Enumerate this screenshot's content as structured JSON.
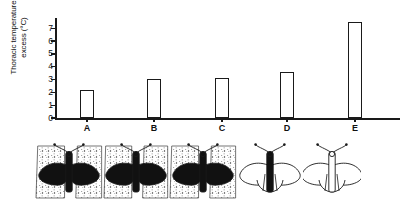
{
  "chart_data": {
    "type": "bar",
    "title": "",
    "xlabel": "",
    "ylabel": "Thoracic temperature excess (°C)",
    "ylabel_line1": "Thoracic temperature",
    "ylabel_line2": "excess (°C)",
    "categories": [
      "A",
      "B",
      "C",
      "D",
      "E"
    ],
    "values": [
      2.2,
      3.05,
      3.1,
      3.6,
      7.5
    ],
    "ylim": [
      0,
      7.8
    ],
    "yticks": [
      0,
      1,
      2,
      3,
      4,
      5,
      6,
      7
    ],
    "ytick_labels": [
      "0",
      "1",
      "2",
      "3",
      "4",
      "5",
      "6",
      "7"
    ],
    "grid": false,
    "legend": false,
    "bar_fill": "#ffffff",
    "bar_edge": "#1a1a1a",
    "axis_color": "#1a1a1a"
  },
  "illustrations": {
    "caption": "",
    "items": [
      {
        "id": "A",
        "name": "moth-on-dark-background-wings-fully-dark",
        "background": "stippled",
        "body_shade": "dark",
        "wing_shade": "dark",
        "wings_spread": true
      },
      {
        "id": "B",
        "name": "moth-on-stippled-background-wings-dark",
        "background": "stippled",
        "body_shade": "dark",
        "wing_shade": "dark",
        "wings_spread": true
      },
      {
        "id": "C",
        "name": "moth-on-stippled-background-wings-part-dark",
        "background": "stippled",
        "body_shade": "dark",
        "wing_shade": "part-dark",
        "wings_spread": true
      },
      {
        "id": "D",
        "name": "moth-plain-background-dark-body-outline-wings",
        "background": "plain",
        "body_shade": "dark",
        "wing_shade": "outline",
        "wings_spread": true
      },
      {
        "id": "E",
        "name": "moth-plain-background-outline-only",
        "background": "plain",
        "body_shade": "outline",
        "wing_shade": "outline",
        "wings_spread": true
      }
    ]
  },
  "colors": {
    "ink": "#1a1a1a",
    "paper": "#ffffff",
    "stipple": "#6b6b6b",
    "dark_fill": "#111111"
  }
}
